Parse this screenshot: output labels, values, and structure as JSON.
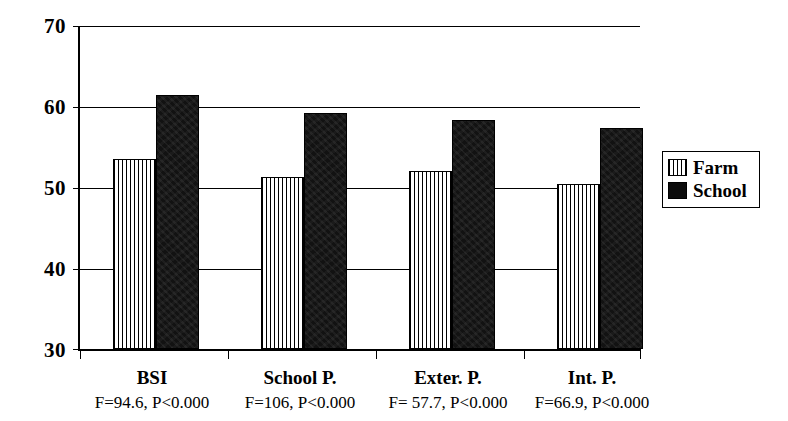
{
  "chart_data": {
    "type": "bar",
    "title": "",
    "subtitle": "",
    "xlabel": "",
    "ylabel": "",
    "ylim": [
      30,
      70
    ],
    "yticks": [
      30,
      40,
      50,
      60,
      70
    ],
    "ytick_labels": [
      "30",
      "40",
      "50",
      "60",
      "70"
    ],
    "grid": true,
    "legend_position": "right",
    "categories": [
      "BSI",
      "School P.",
      "Exter. P.",
      "Int. P."
    ],
    "annotations": [
      "F=94.6, P<0.000",
      "F=106, P<0.000",
      "F= 57.7, P<0.000",
      "F=66.9, P<0.000"
    ],
    "series": [
      {
        "name": "Farm",
        "color": "#ffffff",
        "pattern": "vertical-hatch",
        "values": [
          53.5,
          51.3,
          52.1,
          50.4
        ]
      },
      {
        "name": "School",
        "color": "#111111",
        "pattern": "solid-black",
        "values": [
          61.5,
          59.2,
          58.3,
          57.4
        ]
      }
    ]
  },
  "legend": {
    "items": [
      {
        "label": "Farm",
        "swatch": "hatched-swatch"
      },
      {
        "label": "School",
        "swatch": "black-swatch"
      }
    ]
  },
  "axis": {
    "y_tick_0": "30",
    "y_tick_1": "40",
    "y_tick_2": "50",
    "y_tick_3": "60",
    "y_tick_4": "70"
  },
  "categories": {
    "c0": {
      "label": "BSI",
      "stat": "F=94.6, P<0.000"
    },
    "c1": {
      "label": "School P.",
      "stat": "F=106, P<0.000"
    },
    "c2": {
      "label": "Exter. P.",
      "stat": "F= 57.7, P<0.000"
    },
    "c3": {
      "label": "Int. P.",
      "stat": "F=66.9, P<0.000"
    }
  }
}
